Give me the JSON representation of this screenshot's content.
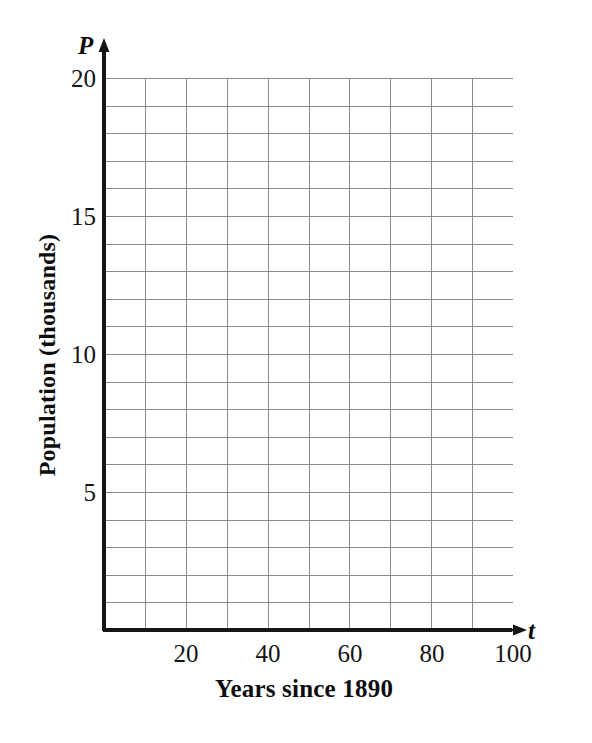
{
  "chart_data": {
    "type": "line",
    "title": "",
    "subtitle": "",
    "xlabel": "Years since 1890",
    "ylabel": "Population (thousands)",
    "x_variable": "t",
    "y_variable": "P",
    "xlim": [
      0,
      100
    ],
    "ylim": [
      0,
      20
    ],
    "x_tick_labels": [
      "20",
      "40",
      "60",
      "80",
      "100"
    ],
    "x_tick_values": [
      20,
      40,
      60,
      80,
      100
    ],
    "y_tick_labels": [
      "5",
      "10",
      "15",
      "20"
    ],
    "y_tick_values": [
      5,
      10,
      15,
      20
    ],
    "x_major_step": 20,
    "y_major_step": 5,
    "x_grid_step": 10,
    "y_grid_step": 1,
    "x_grid_divisions": 10,
    "y_grid_divisions": 20,
    "grid": true,
    "legend": false,
    "legend_position": "none",
    "series": [],
    "x": [],
    "values": [],
    "annotations": []
  },
  "figure": {
    "background_color": "#ffffff",
    "grid_line_color": "#8a8a8a",
    "axis_line_color": "#161616",
    "text_color": "#0d0d0d",
    "axis_arrow_x_name": "x-axis-arrow",
    "axis_arrow_y_name": "y-axis-arrow"
  }
}
